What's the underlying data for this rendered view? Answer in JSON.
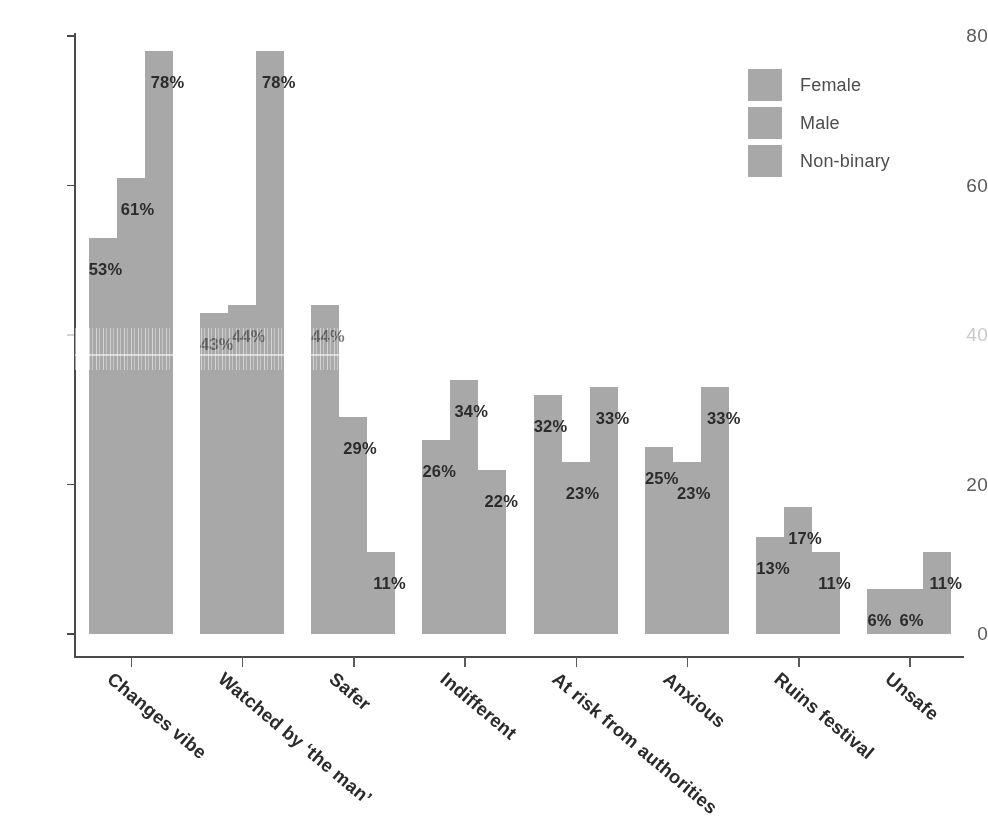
{
  "chart_data": {
    "type": "bar",
    "title": "",
    "subtitle": "",
    "xlabel": "",
    "ylabel": "",
    "ylim": [
      0,
      80
    ],
    "yticks": [
      0,
      20,
      40,
      60,
      80
    ],
    "ytick_labels": [
      "0",
      "20",
      "40",
      "60",
      "80"
    ],
    "grid": false,
    "legend_position": "top-right",
    "orientation": "vertical",
    "grouping": "grouped",
    "value_suffix": "%",
    "categories": [
      "Changes vibe",
      "Watched by ‘the man’",
      "Safer",
      "Indifferent",
      "At risk from authorities",
      "Anxious",
      "Ruins festival",
      "Unsafe"
    ],
    "series": [
      {
        "name": "Female",
        "color": "#a8a8a8",
        "values": [
          53,
          43,
          44,
          26,
          32,
          25,
          13,
          6
        ],
        "labels": [
          "53%",
          "43%",
          "44%",
          "26%",
          "32%",
          "25%",
          "13%",
          "6%"
        ]
      },
      {
        "name": "Male",
        "color": "#a8a8a8",
        "values": [
          61,
          44,
          29,
          34,
          23,
          23,
          17,
          6
        ],
        "labels": [
          "61%",
          "44%",
          "29%",
          "34%",
          "23%",
          "23%",
          "17%",
          "6%"
        ]
      },
      {
        "name": "Non-binary",
        "color": "#a8a8a8",
        "values": [
          78,
          78,
          11,
          22,
          33,
          33,
          11,
          11
        ],
        "labels": [
          "78%",
          "78%",
          "11%",
          "22%",
          "33%",
          "33%",
          "11%",
          "11%"
        ]
      }
    ]
  },
  "legend": {
    "items": [
      {
        "label": "Female"
      },
      {
        "label": "Male"
      },
      {
        "label": "Non-binary"
      }
    ]
  },
  "axis": {
    "y_ticks": [
      {
        "label": "80",
        "value": 80,
        "degraded": false
      },
      {
        "label": "60",
        "value": 60,
        "degraded": false
      },
      {
        "label": "40",
        "value": 40,
        "degraded": true
      },
      {
        "label": "20",
        "value": 20,
        "degraded": false
      },
      {
        "label": "0",
        "value": 0,
        "degraded": false
      }
    ]
  },
  "caption": {
    "text": ""
  }
}
